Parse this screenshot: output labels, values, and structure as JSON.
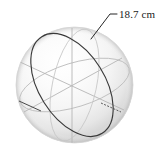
{
  "figure": {
    "kind": "sphere-diagram",
    "background_color": "#ffffff"
  },
  "sphere": {
    "name": "sphere-body",
    "center_x": 74.5,
    "center_y": 85,
    "radius_x": 58.5,
    "radius_y": 58,
    "highlight_color": "#ffffff",
    "midtone_color": "#f2f2f2",
    "shadow_color": "#c8c8c8",
    "outline_color": "#d4d4d4"
  },
  "great_circle": {
    "name": "great-circle-ellipse",
    "stroke_color": "#3c3c3c",
    "stroke_width": 1.1,
    "rotation_deg": -32,
    "radius_x": 33,
    "radius_y": 57
  },
  "axes": [
    {
      "name": "axis-vertical",
      "stroke_color": "#b4b4b4"
    },
    {
      "name": "axis-diagonal-left",
      "stroke_color": "#b4b4b4"
    },
    {
      "name": "axis-diagonal-right",
      "stroke_color": "#b4b4b4"
    },
    {
      "name": "axis-equator-ellipse",
      "stroke_color": "#bdbdbd"
    }
  ],
  "axis_tips": [
    {
      "name": "axis-tip-left",
      "stroke_color": "#555555"
    },
    {
      "name": "axis-tip-right",
      "stroke_color": "#555555"
    }
  ],
  "callout": {
    "name": "dimension-callout",
    "label": "18.7 cm",
    "leader_color": "#1a1a1a",
    "leader_width": 0.9,
    "anchor_x": 91,
    "anchor_y": 39,
    "elbow_x": 110,
    "elbow_y": 14,
    "tail_x": 117,
    "tail_y": 14
  }
}
